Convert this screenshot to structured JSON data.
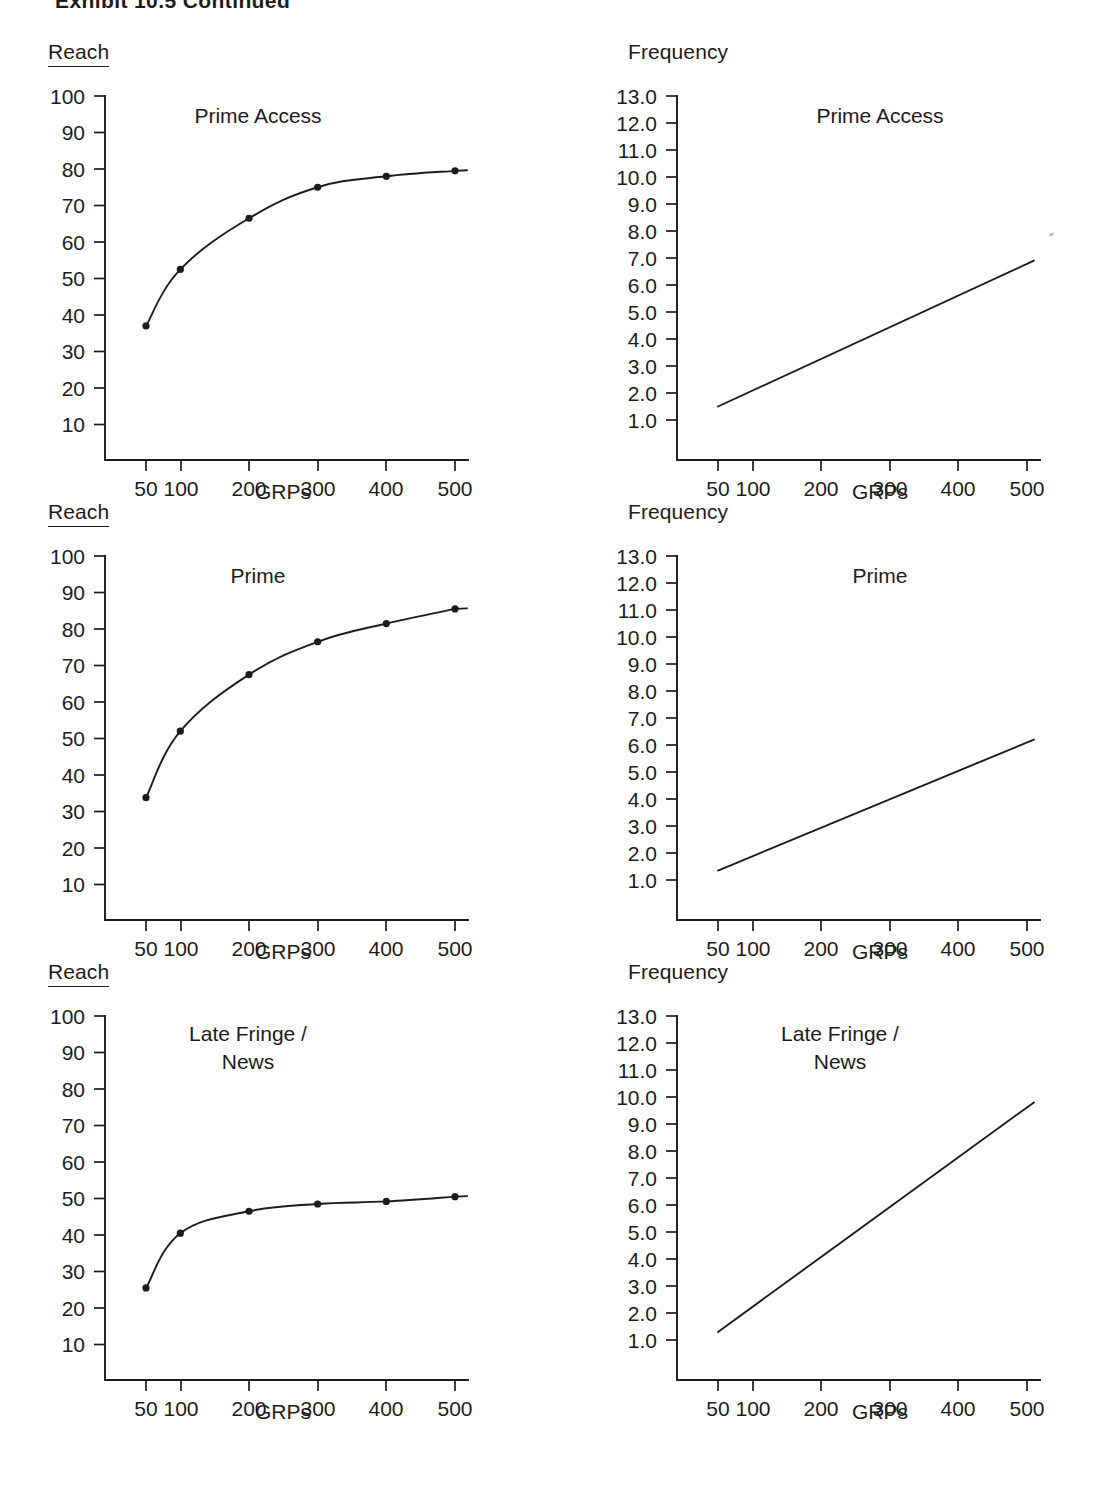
{
  "document": {
    "title": "Exhibit 10.5  Continued"
  },
  "axis_titles": {
    "reach": "Reach",
    "frequency": "Frequency",
    "grps": "GRPs"
  },
  "panels": [
    {
      "id": "prime-access-reach",
      "series_title": "Prime Access",
      "metric": "Reach"
    },
    {
      "id": "prime-access-frequency",
      "series_title": "Prime Access",
      "metric": "Frequency"
    },
    {
      "id": "prime-reach",
      "series_title": "Prime",
      "metric": "Reach"
    },
    {
      "id": "prime-frequency",
      "series_title": "Prime",
      "metric": "Frequency"
    },
    {
      "id": "late-fringe-reach",
      "series_title": "Late Fringe /\nNews",
      "metric": "Reach"
    },
    {
      "id": "late-fringe-frequency",
      "series_title": "Late Fringe /\nNews",
      "metric": "Frequency"
    }
  ],
  "chart_data": [
    {
      "id": "prime-access-reach",
      "type": "line",
      "title": "Prime Access",
      "ylabel": "Reach",
      "xlabel": "GRPs",
      "x": [
        50,
        100,
        200,
        300,
        400,
        500
      ],
      "xticklabels": [
        "50",
        "100",
        "200",
        "300",
        "400",
        "500"
      ],
      "values": [
        37,
        52.5,
        66.5,
        75,
        78,
        79.5
      ],
      "yticks": [
        10,
        20,
        30,
        40,
        50,
        60,
        70,
        80,
        90,
        100
      ],
      "yticklabels": [
        "10",
        "20",
        "30",
        "40",
        "50",
        "60",
        "70",
        "80",
        "90",
        "100"
      ],
      "ylim": [
        0,
        100
      ],
      "xlim": [
        0,
        540
      ],
      "markers": true,
      "grid": false,
      "legend": "none"
    },
    {
      "id": "prime-access-frequency",
      "type": "line",
      "title": "Prime Access",
      "ylabel": "Frequency",
      "xlabel": "GRPs",
      "x": [
        50,
        510
      ],
      "xticklabels": [
        "50",
        "100",
        "200",
        "300",
        "400",
        "500"
      ],
      "values": [
        1.5,
        6.9
      ],
      "yticks": [
        1.0,
        2.0,
        3.0,
        4.0,
        5.0,
        6.0,
        7.0,
        8.0,
        9.0,
        10.0,
        11.0,
        12.0,
        13.0
      ],
      "yticklabels": [
        "1.0",
        "2.0",
        "3.0",
        "4.0",
        "5.0",
        "6.0",
        "7.0",
        "8.0",
        "9.0",
        "10.0",
        "11.0",
        "12.0",
        "13.0"
      ],
      "ylim": [
        0,
        13
      ],
      "xlim": [
        0,
        540
      ],
      "markers": false,
      "grid": false,
      "legend": "none"
    },
    {
      "id": "prime-reach",
      "type": "line",
      "title": "Prime",
      "ylabel": "Reach",
      "xlabel": "GRPs",
      "x": [
        50,
        100,
        200,
        300,
        400,
        500
      ],
      "xticklabels": [
        "50",
        "100",
        "200",
        "300",
        "400",
        "500"
      ],
      "values": [
        33.8,
        52,
        67.5,
        76.5,
        81.5,
        85.5
      ],
      "yticks": [
        10,
        20,
        30,
        40,
        50,
        60,
        70,
        80,
        90,
        100
      ],
      "yticklabels": [
        "10",
        "20",
        "30",
        "40",
        "50",
        "60",
        "70",
        "80",
        "90",
        "100"
      ],
      "ylim": [
        0,
        100
      ],
      "xlim": [
        0,
        540
      ],
      "markers": true,
      "grid": false,
      "legend": "none"
    },
    {
      "id": "prime-frequency",
      "type": "line",
      "title": "Prime",
      "ylabel": "Frequency",
      "xlabel": "GRPs",
      "x": [
        50,
        510
      ],
      "xticklabels": [
        "50",
        "100",
        "200",
        "300",
        "400",
        "500"
      ],
      "values": [
        1.35,
        6.2
      ],
      "yticks": [
        1.0,
        2.0,
        3.0,
        4.0,
        5.0,
        6.0,
        7.0,
        8.0,
        9.0,
        10.0,
        11.0,
        12.0,
        13.0
      ],
      "yticklabels": [
        "1.0",
        "2.0",
        "3.0",
        "4.0",
        "5.0",
        "6.0",
        "7.0",
        "8.0",
        "9.0",
        "10.0",
        "11.0",
        "12.0",
        "13.0"
      ],
      "ylim": [
        0,
        13
      ],
      "xlim": [
        0,
        540
      ],
      "markers": false,
      "grid": false,
      "legend": "none"
    },
    {
      "id": "late-fringe-reach",
      "type": "line",
      "title": "Late Fringe / News",
      "ylabel": "Reach",
      "xlabel": "GRPs",
      "x": [
        50,
        100,
        200,
        300,
        400,
        500
      ],
      "xticklabels": [
        "50",
        "100",
        "200",
        "300",
        "400",
        "500"
      ],
      "values": [
        25.5,
        40.5,
        46.5,
        48.5,
        49.2,
        50.5
      ],
      "yticks": [
        10,
        20,
        30,
        40,
        50,
        60,
        70,
        80,
        90,
        100
      ],
      "yticklabels": [
        "10",
        "20",
        "30",
        "40",
        "50",
        "60",
        "70",
        "80",
        "90",
        "100"
      ],
      "ylim": [
        0,
        100
      ],
      "xlim": [
        0,
        540
      ],
      "markers": true,
      "grid": false,
      "legend": "none"
    },
    {
      "id": "late-fringe-frequency",
      "type": "line",
      "title": "Late Fringe / News",
      "ylabel": "Frequency",
      "xlabel": "GRPs",
      "x": [
        50,
        510
      ],
      "xticklabels": [
        "50",
        "100",
        "200",
        "300",
        "400",
        "500"
      ],
      "values": [
        1.3,
        9.8
      ],
      "yticks": [
        1.0,
        2.0,
        3.0,
        4.0,
        5.0,
        6.0,
        7.0,
        8.0,
        9.0,
        10.0,
        11.0,
        12.0,
        13.0
      ],
      "yticklabels": [
        "1.0",
        "2.0",
        "3.0",
        "4.0",
        "5.0",
        "6.0",
        "7.0",
        "8.0",
        "9.0",
        "10.0",
        "11.0",
        "12.0",
        "13.0"
      ],
      "ylim": [
        0,
        13
      ],
      "xlim": [
        0,
        540
      ],
      "markers": false,
      "grid": false,
      "legend": "none"
    }
  ]
}
